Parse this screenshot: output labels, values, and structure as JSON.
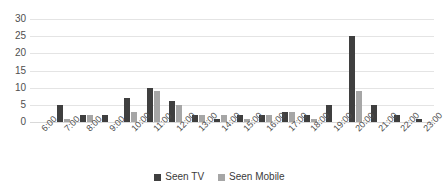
{
  "chart_data": {
    "type": "bar",
    "title": "",
    "subtitle": "",
    "xlabel": "",
    "ylabel": "",
    "ylim": [
      0,
      30
    ],
    "yticks": [
      0,
      5,
      10,
      15,
      20,
      25,
      30
    ],
    "grid": true,
    "legend_position": "bottom-center",
    "categories": [
      "6:00",
      "7:00",
      "8:00",
      "9:00",
      "10:00",
      "11:00",
      "12:00",
      "13:00",
      "14:00",
      "15:00",
      "16:00",
      "17:00",
      "18:00",
      "19:00",
      "20:00",
      "21:00",
      "22:00",
      "23:00"
    ],
    "series": [
      {
        "name": "Seen TV",
        "color": "#3F3F3F",
        "values": [
          0,
          5,
          2,
          2,
          7,
          10,
          6,
          2,
          1,
          2,
          2,
          3,
          2,
          5,
          25,
          5,
          2,
          1
        ]
      },
      {
        "name": "Seen Mobile",
        "color": "#A6A6A6",
        "values": [
          0,
          1,
          2,
          0,
          3,
          9,
          5,
          2,
          2,
          1,
          2,
          3,
          1,
          0,
          9,
          0,
          0,
          0
        ]
      }
    ]
  },
  "legend": {
    "entries": [
      {
        "label": "Seen TV"
      },
      {
        "label": "Seen Mobile"
      }
    ]
  },
  "colors": {
    "series_tv": "#3F3F3F",
    "series_mobile": "#A6A6A6",
    "gridline": "#E4E4E4",
    "axis_text": "#4F4F4F",
    "background": "#FFFFFF"
  }
}
